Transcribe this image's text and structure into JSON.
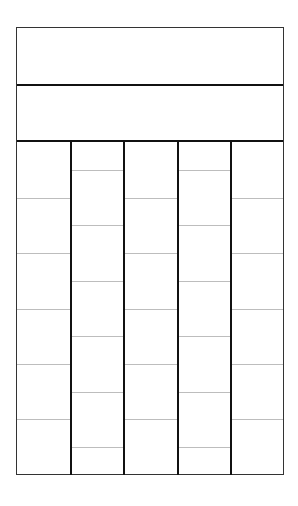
{
  "diagram": {
    "type": "blank-template-grid",
    "header_bands": [
      {
        "label": ""
      },
      {
        "label": ""
      }
    ],
    "columns": [
      {
        "offset": "full",
        "line_positions_pct": [
          16.7,
          33.3,
          50,
          66.7,
          83.3
        ]
      },
      {
        "offset": "half",
        "line_positions_pct": [
          8.3,
          25,
          41.7,
          58.3,
          75,
          91.7
        ]
      },
      {
        "offset": "full",
        "line_positions_pct": [
          16.7,
          33.3,
          50,
          66.7,
          83.3
        ]
      },
      {
        "offset": "half",
        "line_positions_pct": [
          8.3,
          25,
          41.7,
          58.3,
          75,
          91.7
        ]
      },
      {
        "offset": "full",
        "line_positions_pct": [
          16.7,
          33.3,
          50,
          66.7,
          83.3
        ]
      }
    ],
    "colors": {
      "frame": "#333333",
      "thick_line": "#111111",
      "thin_line": "#bdbdbd",
      "background": "#ffffff"
    }
  }
}
